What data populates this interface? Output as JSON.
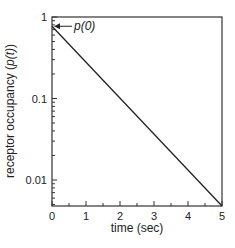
{
  "chart_data": {
    "type": "line",
    "title": "",
    "xlabel": "time (sec)",
    "ylabel": "receptor occupancy (p(t))",
    "xlim": [
      0,
      5
    ],
    "ylim": [
      0.0048,
      1
    ],
    "yscale": "log",
    "xticks": [
      0,
      1,
      2,
      3,
      4,
      5
    ],
    "xtick_labels": [
      "0",
      "1",
      "2",
      "3",
      "4",
      "5"
    ],
    "yticks": [
      0.01,
      0.1,
      1
    ],
    "ytick_labels": [
      "0.01",
      "0.1",
      "1"
    ],
    "grid": false,
    "legend": null,
    "series": [
      {
        "name": "p(t)",
        "x": [
          0,
          5
        ],
        "y": [
          0.77,
          0.0048
        ]
      }
    ],
    "annotations": [
      {
        "text": "p(0)",
        "x": 0,
        "y": 0.77,
        "arrow": true
      }
    ]
  },
  "labels": {
    "xlabel": "time (sec)",
    "ylabel_prefix": "receptor occupancy (",
    "ylabel_var": "p(t)",
    "ylabel_suffix": ")",
    "annotation": "p(0)",
    "annotation_arrow": "←"
  }
}
